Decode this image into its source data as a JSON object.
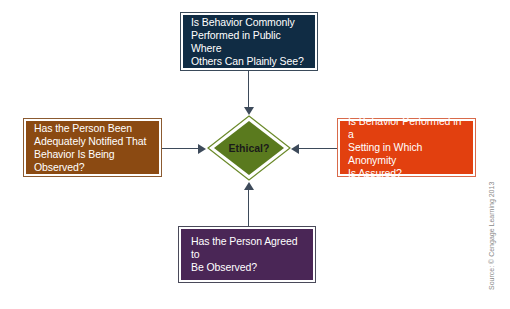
{
  "diagram": {
    "center": {
      "label": "Ethical?",
      "fill": "#5a7a1e",
      "border": "#6b8a2a"
    },
    "top": {
      "lines": [
        "Is Behavior Commonly",
        "Performed in Public Where",
        "Others Can Plainly See?"
      ],
      "fill": "#102c44",
      "border": "#3a4a5a"
    },
    "left": {
      "lines": [
        "Has the Person Been",
        "Adequately Notified That",
        "Behavior Is Being Observed?"
      ],
      "fill": "#8b4a12",
      "border": "#8b5a30"
    },
    "right": {
      "lines": [
        "Is Behavior Performed in a",
        "Setting in Which Anonymity",
        "Is Assured?"
      ],
      "fill": "#e2400f",
      "border": "#d86a4a"
    },
    "bottom": {
      "lines": [
        "Has the Person Agreed to",
        "Be Observed?"
      ],
      "fill": "#4a2656",
      "border": "#4a4a5a"
    },
    "connector_color": "#3d4a5a",
    "source": "Source: © Cengage Learning 2013"
  }
}
